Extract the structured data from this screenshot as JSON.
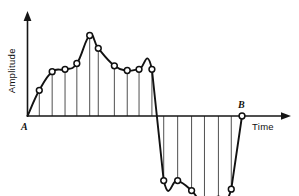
{
  "figure": {
    "name": "amplitude-vs-time-waveform",
    "background_color": "#ffffff",
    "curve_color": "#121212",
    "stem_color": "#3c3c3c",
    "marker_fill_color": "#ffffff",
    "marker_stroke_color": "#101010"
  },
  "labels": {
    "y_axis_title": "Amplitude",
    "x_axis_title": "Time",
    "start_point": "A",
    "end_point": "B"
  },
  "chart_data": {
    "type": "line",
    "title": "",
    "subtitle": "",
    "xlabel": "Time",
    "ylabel": "Amplitude",
    "grid": false,
    "legend": "none",
    "axis_origin_label": "A",
    "axis_end_label": "B",
    "xlim": [
      0,
      100
    ],
    "ylim": [
      -46,
      72
    ],
    "axes": {
      "x_axis_arrow": true,
      "y_axis_arrow": true,
      "x_axis_starts_at_origin": true,
      "y_axis_starts_at_origin": true
    },
    "stems": true,
    "markers": "open-circle",
    "x": [
      0,
      5.5,
      11.5,
      17.5,
      23,
      29,
      33,
      40.5,
      46.5,
      52,
      58,
      63.5,
      70,
      76.5,
      82.5,
      89,
      95,
      100
    ],
    "y": [
      0,
      22,
      38,
      40,
      45,
      69,
      58,
      43,
      39,
      40,
      40,
      -45,
      -45,
      -52,
      -62,
      -58,
      -51,
      0
    ],
    "points": [
      {
        "index": 0,
        "x": 0,
        "y": 0,
        "label": "A",
        "marker": false,
        "stem": false
      },
      {
        "index": 1,
        "x": 5.5,
        "y": 22,
        "label": "",
        "marker": true,
        "stem": true
      },
      {
        "index": 2,
        "x": 11.5,
        "y": 38,
        "label": "",
        "marker": true,
        "stem": true
      },
      {
        "index": 3,
        "x": 17.5,
        "y": 40,
        "label": "",
        "marker": true,
        "stem": true
      },
      {
        "index": 4,
        "x": 23,
        "y": 45,
        "label": "",
        "marker": true,
        "stem": true
      },
      {
        "index": 5,
        "x": 29,
        "y": 69,
        "label": "",
        "marker": true,
        "stem": true
      },
      {
        "index": 6,
        "x": 33,
        "y": 58,
        "label": "",
        "marker": true,
        "stem": true
      },
      {
        "index": 7,
        "x": 40.5,
        "y": 43,
        "label": "",
        "marker": true,
        "stem": true
      },
      {
        "index": 8,
        "x": 46.5,
        "y": 39,
        "label": "",
        "marker": true,
        "stem": true
      },
      {
        "index": 9,
        "x": 52,
        "y": 40,
        "label": "",
        "marker": true,
        "stem": true
      },
      {
        "index": 10,
        "x": 58,
        "y": 40,
        "label": "",
        "marker": true,
        "stem": true
      },
      {
        "index": 11,
        "x": 63.5,
        "y": -45,
        "label": "",
        "marker": true,
        "stem": true
      },
      {
        "index": 12,
        "x": 70,
        "y": -45,
        "label": "",
        "marker": true,
        "stem": true
      },
      {
        "index": 13,
        "x": 76.5,
        "y": -52,
        "label": "",
        "marker": true,
        "stem": true
      },
      {
        "index": 14,
        "x": 82.5,
        "y": -62,
        "label": "",
        "marker": true,
        "stem": true
      },
      {
        "index": 15,
        "x": 89,
        "y": -58,
        "label": "",
        "marker": true,
        "stem": true
      },
      {
        "index": 16,
        "x": 95,
        "y": -51,
        "label": "",
        "marker": true,
        "stem": true
      },
      {
        "index": 17,
        "x": 100,
        "y": 0,
        "label": "B",
        "marker": true,
        "stem": false
      }
    ]
  }
}
